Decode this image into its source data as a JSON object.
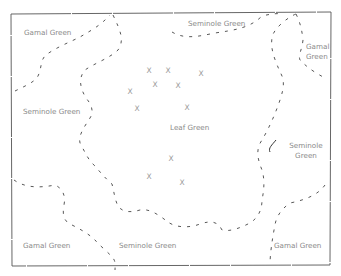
{
  "map": {
    "border_color": "#555555",
    "boundary_color": "#444444",
    "regions": [
      {
        "id": "gamal-top-left",
        "label": "Gamal Green"
      },
      {
        "id": "seminole-top",
        "label": "Seminole Green"
      },
      {
        "id": "gamal-top-right",
        "label": "Gamal Green"
      },
      {
        "id": "seminole-left",
        "label": "Seminole Green"
      },
      {
        "id": "leaf-center",
        "label": "Leaf Green"
      },
      {
        "id": "seminole-right",
        "label": "Seminole Green"
      },
      {
        "id": "gamal-bottom-left",
        "label": "Gamal Green"
      },
      {
        "id": "seminole-bottom",
        "label": "Seminole Green"
      },
      {
        "id": "gamal-bottom-right",
        "label": "Gamal Green"
      }
    ],
    "markers": [
      {
        "symbol": "X",
        "x": 149,
        "y": 71
      },
      {
        "symbol": "X",
        "x": 168,
        "y": 71
      },
      {
        "symbol": "X",
        "x": 201,
        "y": 74
      },
      {
        "symbol": "X",
        "x": 155,
        "y": 85
      },
      {
        "symbol": "X",
        "x": 178,
        "y": 86
      },
      {
        "symbol": "X",
        "x": 130,
        "y": 92
      },
      {
        "symbol": "X",
        "x": 137,
        "y": 109
      },
      {
        "symbol": "X",
        "x": 187,
        "y": 108
      },
      {
        "symbol": "X",
        "x": 171,
        "y": 159
      },
      {
        "symbol": "X",
        "x": 149,
        "y": 177
      },
      {
        "symbol": "X",
        "x": 182,
        "y": 183
      }
    ]
  }
}
